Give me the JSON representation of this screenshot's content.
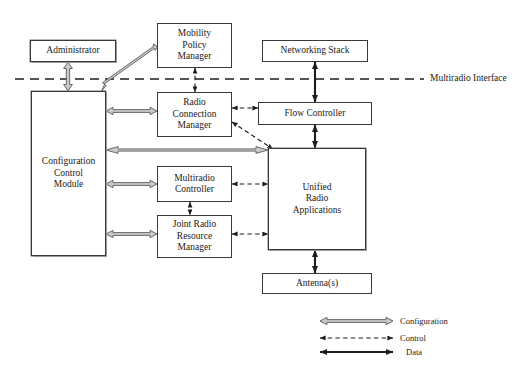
{
  "diagram": {
    "background_color": "#ffffff",
    "line_color": "#2b2b2b",
    "config_arrow_fill": "#c9c9c9",
    "nodes": [
      {
        "id": "administrator",
        "label": "Administrator"
      },
      {
        "id": "config_control",
        "label": "Configuration\nControl\nModule"
      },
      {
        "id": "mobility_policy",
        "label": "Mobility\nPolicy\nManager"
      },
      {
        "id": "radio_connection",
        "label": "Radio\nConnection\nManager"
      },
      {
        "id": "multiradio_ctrl",
        "label": "Multiradio\nController"
      },
      {
        "id": "joint_radio",
        "label": "Joint Radio\nResource\nManager"
      },
      {
        "id": "networking_stack",
        "label": "Networking Stack"
      },
      {
        "id": "flow_controller",
        "label": "Flow Controller"
      },
      {
        "id": "unified_radio",
        "label": "Unified\nRadio\nApplications"
      },
      {
        "id": "antenna",
        "label": "Antenna(s)"
      }
    ],
    "interface_line_label": "Multiradio Interface",
    "legend": {
      "items": [
        {
          "key": "configuration",
          "label": "Configuration",
          "style": "hollow-double-arrow"
        },
        {
          "key": "control",
          "label": "Control",
          "style": "dashed-double-arrow"
        },
        {
          "key": "data",
          "label": "Data",
          "style": "solid-double-arrow"
        }
      ]
    },
    "connections": [
      {
        "from": "administrator",
        "to": "config_control",
        "type": "configuration",
        "direction": "both"
      },
      {
        "from": "config_control",
        "to": "mobility_policy",
        "type": "configuration",
        "direction": "both"
      },
      {
        "from": "config_control",
        "to": "radio_connection",
        "type": "configuration",
        "direction": "both"
      },
      {
        "from": "config_control",
        "to": "unified_radio",
        "type": "configuration",
        "direction": "both"
      },
      {
        "from": "config_control",
        "to": "multiradio_ctrl",
        "type": "configuration",
        "direction": "both"
      },
      {
        "from": "config_control",
        "to": "joint_radio",
        "type": "configuration",
        "direction": "both"
      },
      {
        "from": "mobility_policy",
        "to": "radio_connection",
        "type": "control",
        "direction": "both"
      },
      {
        "from": "radio_connection",
        "to": "flow_controller",
        "type": "control",
        "direction": "both"
      },
      {
        "from": "radio_connection",
        "to": "unified_radio",
        "type": "control",
        "direction": "both"
      },
      {
        "from": "multiradio_ctrl",
        "to": "unified_radio",
        "type": "control",
        "direction": "both"
      },
      {
        "from": "multiradio_ctrl",
        "to": "joint_radio",
        "type": "control",
        "direction": "both"
      },
      {
        "from": "joint_radio",
        "to": "unified_radio",
        "type": "control",
        "direction": "both"
      },
      {
        "from": "networking_stack",
        "to": "flow_controller",
        "type": "data",
        "direction": "both"
      },
      {
        "from": "flow_controller",
        "to": "unified_radio",
        "type": "data",
        "direction": "both"
      },
      {
        "from": "unified_radio",
        "to": "antenna",
        "type": "data",
        "direction": "both"
      }
    ]
  }
}
